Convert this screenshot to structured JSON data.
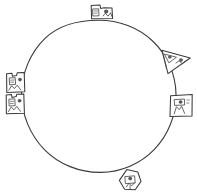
{
  "figure": {
    "title": "Circle with objects placed around its perimeter",
    "style": "hand-drawn pencil sketch",
    "background_color": "#ffffff",
    "stroke_color": "#3a3a3a",
    "width": 197,
    "height": 195
  },
  "circle": {
    "name": "main-circle",
    "center_x": 98,
    "center_y": 99,
    "radius_x": 78,
    "radius_y": 79,
    "stroke_color": "#3a3a3a",
    "fill": "none"
  },
  "objects": [
    {
      "id": "top-box",
      "label": "box-object-top",
      "shape": "rectangular box",
      "position": "top",
      "angle_deg": 90,
      "x": 101,
      "y": 11,
      "width": 22,
      "height": 15
    },
    {
      "id": "upper-right-wedge",
      "label": "triangle-object-upper-right",
      "shape": "triangular wedge",
      "position": "upper-right",
      "angle_deg": 35,
      "x": 174,
      "y": 62,
      "width": 28,
      "height": 22
    },
    {
      "id": "right-box",
      "label": "box-object-right",
      "shape": "rectangular box",
      "position": "right",
      "angle_deg": 350,
      "x": 180,
      "y": 105,
      "width": 22,
      "height": 22
    },
    {
      "id": "bottom-hexagon",
      "label": "hexagon-object-bottom",
      "shape": "hexagon",
      "position": "bottom",
      "angle_deg": 265,
      "x": 128,
      "y": 180,
      "width": 22,
      "height": 22
    },
    {
      "id": "left-box-lower",
      "label": "box-object-left-lower",
      "shape": "rectangular box",
      "position": "left-lower",
      "angle_deg": 188,
      "x": 16,
      "y": 103,
      "width": 20,
      "height": 19
    },
    {
      "id": "left-box-upper",
      "label": "box-object-left-upper",
      "shape": "rectangular box",
      "position": "left-upper",
      "angle_deg": 172,
      "x": 16,
      "y": 82,
      "width": 20,
      "height": 19
    }
  ],
  "counts": {
    "objects_total": 6,
    "objects_total_label": "6"
  }
}
